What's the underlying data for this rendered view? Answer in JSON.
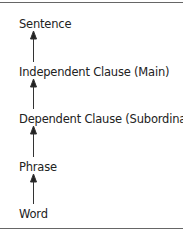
{
  "diagram": {
    "levels": [
      {
        "label": "Sentence"
      },
      {
        "label": "Independent Clause (Main)"
      },
      {
        "label": "Dependent Clause (Subordinate)"
      },
      {
        "label": "Phrase"
      },
      {
        "label": "Word"
      }
    ],
    "arrow_direction": "upward",
    "colors": {
      "text": "#222222",
      "arrow": "#222222",
      "rule": "#666666"
    }
  }
}
